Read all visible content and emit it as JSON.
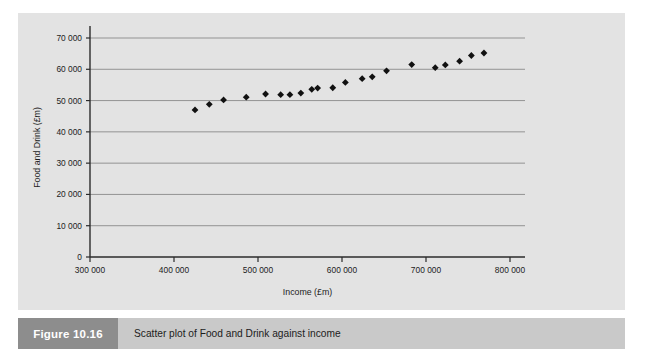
{
  "figure": {
    "number_label": "Figure 10.16",
    "caption": "Scatter plot of Food and Drink against income"
  },
  "colors": {
    "page_background": "#ffffff",
    "plot_background": "#e3e3e3",
    "gridline": "#8a8a8a",
    "axis_line": "#2b2b2b",
    "marker": "#111111",
    "caption_bar": "#c9c9c9",
    "figure_number_box": "#8d8d8d",
    "figure_number_text": "#ffffff",
    "text": "#1c1c1c"
  },
  "chart_data": {
    "type": "scatter",
    "title": "",
    "xlabel": "Income (£m)",
    "ylabel": "Food and Drink (£m)",
    "xlim": [
      300000,
      800000
    ],
    "ylim": [
      0,
      70000
    ],
    "xticks": [
      300000,
      400000,
      500000,
      600000,
      700000,
      800000
    ],
    "xtick_labels": [
      "300 000",
      "400 000",
      "500 000",
      "600 000",
      "700 000",
      "800 000"
    ],
    "yticks": [
      0,
      10000,
      20000,
      30000,
      40000,
      50000,
      60000,
      70000
    ],
    "ytick_labels": [
      "0",
      "10 000",
      "20 000",
      "30 000",
      "40 000",
      "50 000",
      "60 000",
      "70 000"
    ],
    "grid": "horizontal",
    "legend": "none",
    "marker": "diamond",
    "series": [
      {
        "name": "Food and Drink",
        "points": [
          [
            425000,
            47000
          ],
          [
            442000,
            48800
          ],
          [
            459000,
            50200
          ],
          [
            486000,
            51100
          ],
          [
            509000,
            52100
          ],
          [
            527000,
            51900
          ],
          [
            538000,
            51900
          ],
          [
            551000,
            52400
          ],
          [
            564000,
            53600
          ],
          [
            571000,
            54000
          ],
          [
            589000,
            54100
          ],
          [
            604000,
            55800
          ],
          [
            624000,
            57000
          ],
          [
            636000,
            57600
          ],
          [
            653000,
            59500
          ],
          [
            683000,
            61500
          ],
          [
            711000,
            60500
          ],
          [
            723000,
            61400
          ],
          [
            740000,
            62600
          ],
          [
            754000,
            64400
          ],
          [
            769000,
            65200
          ]
        ]
      }
    ]
  }
}
